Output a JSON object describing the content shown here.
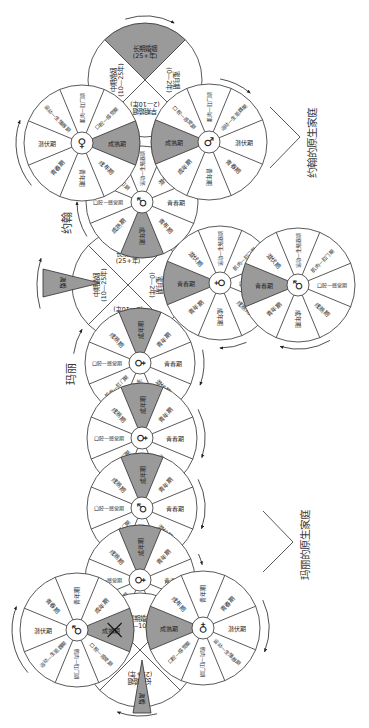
{
  "diagram": {
    "john_family_title": "约翰的原生家庭",
    "mary_family_title": "玛丽的原生家庭",
    "john_label": "约翰",
    "mary_label": "玛丽"
  },
  "life_stages": [
    "口腔—感觉期",
    "肌肉—肛门期",
    "运动—生殖器期",
    "潜伏期",
    "青春期",
    "青年期",
    "成年期",
    "成熟期"
  ],
  "marriage_stages": [
    {
      "name": "蜜月期",
      "years": "(0—2年)"
    },
    {
      "name": "早期婚姻",
      "years": "(2—10年)"
    },
    {
      "name": "中期婚姻",
      "years": "(10—25年)"
    },
    {
      "name": "长期婚姻",
      "years": "(25+年)"
    }
  ],
  "wheels": {
    "john_parents_marriage": {
      "type": "marriage",
      "shaded_stage": "长期婚姻"
    },
    "john_mother": {
      "type": "individual",
      "symbol": "♀",
      "shaded_stage": "成熟期"
    },
    "john_father": {
      "type": "individual",
      "symbol": "♂",
      "shaded_stage": "成熟期"
    },
    "john": {
      "type": "individual",
      "symbol": "♂",
      "shaded_stage": "成年期"
    },
    "john_mary_marriage": {
      "type": "marriage",
      "event": "离婚"
    },
    "child_1": {
      "type": "individual",
      "symbol": "♀",
      "shaded_stage": "青春期"
    },
    "child_2": {
      "type": "individual",
      "symbol": "♂",
      "shaded_stage": "青春期"
    },
    "mary": {
      "type": "individual",
      "symbol": "♀",
      "shaded_stage": "成年期"
    },
    "mary_sibling_1": {
      "type": "individual",
      "symbol": "♀",
      "shaded_stage": "成年期"
    },
    "mary_sibling_2": {
      "type": "individual",
      "symbol": "♂",
      "shaded_stage": "成年期"
    },
    "mary_sibling_3": {
      "type": "individual",
      "symbol": "♀",
      "shaded_stage": "成年期"
    },
    "mary_father": {
      "type": "individual",
      "symbol": "♂",
      "shaded_stage": "成熟期",
      "crossed_out": true
    },
    "mary_mother": {
      "type": "individual",
      "symbol": "♀",
      "shaded_stage": "成熟期"
    },
    "mary_parents_marriage": {
      "type": "marriage",
      "event": "离婚"
    }
  },
  "colors": {
    "shade": "#9a9a9a",
    "line": "#2e2e2e",
    "background": "#ffffff"
  }
}
